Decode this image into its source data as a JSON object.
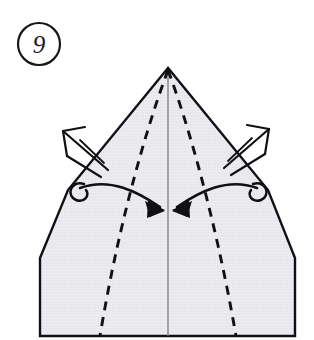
{
  "figure": {
    "kind": "origami-fold-diagram",
    "step_number": "9",
    "caption": "",
    "colors": {
      "paper_fill": "#e6e6ea",
      "paper_edge": "#111014",
      "fold_line": "#111014",
      "center_line": "#6f6f76",
      "arrow_solid": "#111014",
      "arrow_open": "#111014",
      "background": "#ffffff",
      "step_circle": "#17161a"
    },
    "step_badge": {
      "label": "9",
      "shape": "circle",
      "cx": 39,
      "cy": 44,
      "r": 21
    },
    "paper": {
      "name": "kite-base-front",
      "apex": [
        168,
        68
      ],
      "outline_points": "168,68 68,190 40,258 40,336 295,336 295,258 268,190",
      "bottom_edge_y": 336,
      "left_edge_x": 40,
      "right_edge_x": 295
    },
    "fold_lines": [
      {
        "name": "left-valley-fold",
        "style": "dashed",
        "path": "M 168 70 C 150 118, 120 215, 100 336"
      },
      {
        "name": "right-valley-fold",
        "style": "dashed",
        "path": "M 168 70 C 186 118, 215 215, 236 336"
      }
    ],
    "center_line": {
      "name": "vertical-center-crease",
      "style": "solid-thin",
      "x": 168,
      "y1": 70,
      "y2": 336
    },
    "fold_arrows": [
      {
        "name": "left-fold-inward-arrow",
        "direction": "inward-right",
        "curl_side": "left",
        "curl_center": [
          78,
          190
        ],
        "tip": [
          163,
          210
        ]
      },
      {
        "name": "right-fold-inward-arrow",
        "direction": "inward-left",
        "curl_side": "right",
        "curl_center": [
          259,
          190
        ],
        "tip": [
          174,
          210
        ]
      }
    ],
    "pull_arrows": [
      {
        "name": "left-pull-open-arrow",
        "direction": "up-left",
        "tip": [
          62,
          130
        ],
        "tail": [
          104,
          167
        ]
      },
      {
        "name": "right-pull-open-arrow",
        "direction": "up-right",
        "tip": [
          268,
          128
        ],
        "tail": [
          226,
          165
        ]
      }
    ]
  }
}
